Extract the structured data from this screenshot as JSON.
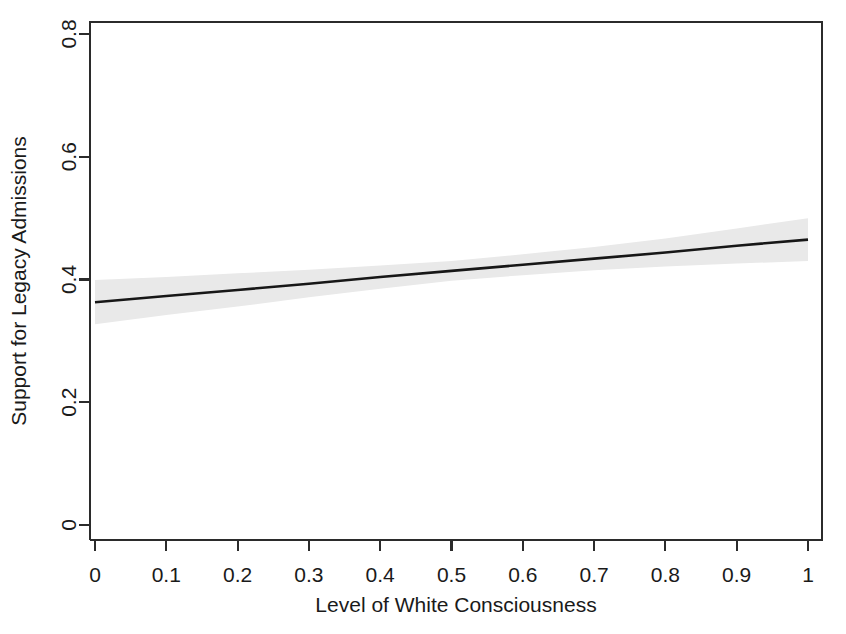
{
  "chart_data": {
    "type": "line",
    "title": "",
    "subtitle": "",
    "xlabel": "Level of White Consciousness",
    "ylabel": "Support for Legacy Admissions",
    "xlim": [
      0,
      1
    ],
    "ylim": [
      0,
      0.8
    ],
    "grid": false,
    "legend": null,
    "legend_position": "none",
    "xticks": [
      0,
      0.1,
      0.2,
      0.3,
      0.4,
      0.5,
      0.6,
      0.7,
      0.8,
      0.9,
      1
    ],
    "xticklabels": [
      "0",
      "0.1",
      "0.2",
      "0.3",
      "0.4",
      "0.5",
      "0.6",
      "0.7",
      "0.8",
      "0.9",
      "1"
    ],
    "yticks": [
      0,
      0.2,
      0.4,
      0.6,
      0.8
    ],
    "yticklabels": [
      "0",
      "0.2",
      "0.4",
      "0.6",
      "0.8"
    ],
    "series": [
      {
        "name": "Predicted support",
        "kind": "line",
        "color": "#171717",
        "x": [
          0,
          0.1,
          0.2,
          0.3,
          0.4,
          0.5,
          0.6,
          0.7,
          0.8,
          0.9,
          1
        ],
        "values": [
          0.363,
          0.373,
          0.383,
          0.393,
          0.404,
          0.414,
          0.424,
          0.434,
          0.444,
          0.455,
          0.465
        ]
      },
      {
        "name": "95% confidence interval",
        "kind": "band",
        "color": "#e9e9e9",
        "x": [
          0,
          0.1,
          0.2,
          0.3,
          0.4,
          0.5,
          0.6,
          0.7,
          0.8,
          0.9,
          1
        ],
        "lower": [
          0.327,
          0.342,
          0.356,
          0.371,
          0.385,
          0.398,
          0.407,
          0.415,
          0.421,
          0.426,
          0.43
        ],
        "upper": [
          0.399,
          0.404,
          0.41,
          0.416,
          0.423,
          0.43,
          0.441,
          0.453,
          0.467,
          0.483,
          0.5
        ]
      }
    ],
    "annotations": []
  },
  "axes": {
    "x_axis_title": "Level of White Consciousness",
    "y_axis_title": "Support for Legacy Admissions"
  },
  "colors": {
    "line": "#171717",
    "band": "#e9e9e9",
    "frame": "#2b2b2b",
    "text": "#1a1a1a",
    "background": "#ffffff"
  }
}
